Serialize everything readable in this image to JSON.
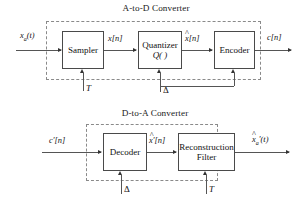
{
  "figure": {
    "type": "block-diagram",
    "background": "#ffffff",
    "line_color": "#555555",
    "dash_color": "#8a8a8a"
  },
  "adc": {
    "title": "A-to-D Converter",
    "blocks": [
      {
        "name": "sampler",
        "line1": "Sampler",
        "line2": ""
      },
      {
        "name": "quantizer",
        "line1": "Quantizer",
        "line2": "Q( )"
      },
      {
        "name": "encoder",
        "line1": "Encoder",
        "line2": ""
      }
    ],
    "signals": {
      "input": "x",
      "input_sub": "a",
      "input_arg": "(t)",
      "sampler_out": "x[n]",
      "quantizer_out_base": "x",
      "quantizer_out_arg": "[n]",
      "quantizer_out_hat": "^",
      "output": "c[n]"
    },
    "params": {
      "sampling_period": "T",
      "step_size": "Δ"
    }
  },
  "dac": {
    "title": "D-to-A Converter",
    "blocks": [
      {
        "name": "decoder",
        "line1": "Decoder",
        "line2": ""
      },
      {
        "name": "reconstruction-filter",
        "line1": "Reconstruction",
        "line2": "Filter"
      }
    ],
    "signals": {
      "input": "c′[n]",
      "decoder_out_base": "x′",
      "decoder_out_arg": "[n]",
      "decoder_out_hat": "^",
      "output_base": "x",
      "output_sub": "a",
      "output_prime": "′",
      "output_arg": "(t)",
      "output_hat": "^"
    },
    "params": {
      "step_size": "Δ",
      "sampling_period": "T"
    }
  }
}
